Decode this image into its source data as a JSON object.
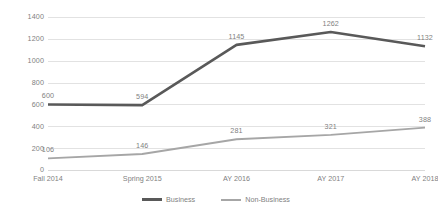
{
  "chart_data": {
    "type": "line",
    "title": "",
    "xlabel": "",
    "ylabel": "",
    "categories": [
      "Fall 2014",
      "Spring 2015",
      "AY 2016",
      "AY 2017",
      "AY 2018"
    ],
    "series": [
      {
        "name": "Business",
        "color": "#595959",
        "values": [
          600,
          594,
          1145,
          1262,
          1132
        ],
        "labels": [
          "600",
          "594",
          "1145",
          "1262",
          "1132"
        ]
      },
      {
        "name": "Non-Business",
        "color": "#a6a6a6",
        "values": [
          106,
          146,
          281,
          321,
          388
        ],
        "labels": [
          "106",
          "146",
          "281",
          "321",
          "388"
        ]
      }
    ],
    "ylim": [
      0,
      1400
    ],
    "ytick_values": [
      0,
      200,
      400,
      600,
      800,
      1000,
      1200,
      1400
    ],
    "ytick_labels": [
      "0",
      "200",
      "400",
      "600",
      "800",
      "1000",
      "1200",
      "1400"
    ],
    "grid": true,
    "legend_position": "bottom",
    "show_data_labels": true,
    "markers": false
  },
  "legend": {
    "items": [
      {
        "label": "Business",
        "color": "#595959"
      },
      {
        "label": "Non-Business",
        "color": "#a6a6a6"
      }
    ]
  },
  "colors": {
    "background": "#ffffff",
    "gridline": "#e2e2e2",
    "axis_text": "#7f7f7f",
    "business": "#595959",
    "nonbusiness": "#a6a6a6"
  }
}
